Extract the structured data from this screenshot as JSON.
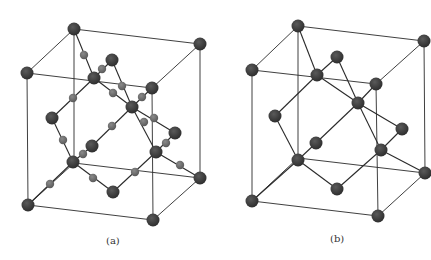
{
  "figure": {
    "panels": [
      {
        "id": "a",
        "label": "(a)"
      },
      {
        "id": "b",
        "label": "(b)"
      }
    ],
    "colors": {
      "background": "#ffffff",
      "edge": "#2a2a2a",
      "large_atom": "#3b3b3b",
      "small_atom": "#6e6e6e"
    }
  }
}
